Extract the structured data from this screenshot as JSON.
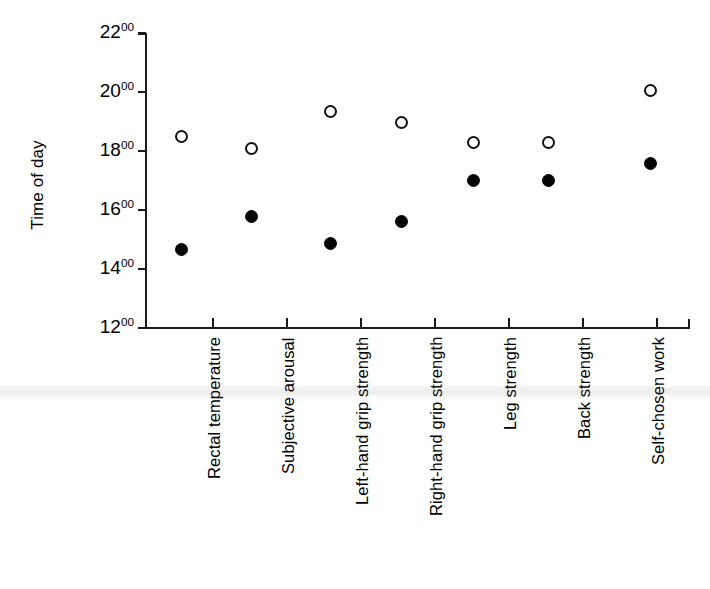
{
  "chart_data": {
    "type": "scatter",
    "title": "",
    "xlabel": "",
    "ylabel": "Time of day",
    "ylim": [
      12,
      22
    ],
    "yticks": [
      12,
      14,
      16,
      18,
      20,
      22
    ],
    "ytick_labels": [
      "12",
      "14",
      "16",
      "18",
      "20",
      "22"
    ],
    "ytick_suffix": "00",
    "grid": false,
    "legend": "none",
    "categories": [
      "Rectal temperature",
      "Subjective arousal",
      "Left-hand grip strength",
      "Right-hand grip strength",
      "Leg strength",
      "Back strength",
      "Self-chosen work"
    ],
    "series": [
      {
        "name": "open-circle-series",
        "marker": "open-circle",
        "color": "#111111",
        "values": [
          18.5,
          18.08,
          19.33,
          18.97,
          18.28,
          18.28,
          20.05
        ],
        "value_labels": [
          "1830",
          "1805",
          "1920",
          "1858",
          "1817",
          "1817",
          "2003"
        ]
      },
      {
        "name": "filled-circle-series",
        "marker": "filled-circle",
        "color": "#050505",
        "values": [
          14.67,
          15.78,
          14.85,
          15.6,
          17.0,
          17.0,
          17.57
        ],
        "value_labels": [
          "1440",
          "1547",
          "1451",
          "1536",
          "1700",
          "1700",
          "1734"
        ]
      }
    ]
  }
}
